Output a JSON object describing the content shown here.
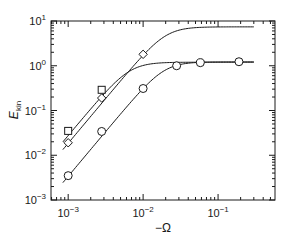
{
  "chart_data": {
    "type": "line",
    "title": "",
    "xlabel": "−Ω",
    "ylabel": "E_kin",
    "xscale": "log",
    "yscale": "log",
    "xlim": [
      0.00059,
      0.575
    ],
    "ylim": [
      0.001,
      10
    ],
    "grid": false,
    "legend": null,
    "x_ticks": [
      {
        "value": 0.001,
        "base": "10",
        "exp": "−3"
      },
      {
        "value": 0.01,
        "base": "10",
        "exp": "−2"
      },
      {
        "value": 0.1,
        "base": "10",
        "exp": "−1"
      }
    ],
    "y_ticks": [
      {
        "value": 0.001,
        "base": "10",
        "exp": "−3"
      },
      {
        "value": 0.01,
        "base": "10",
        "exp": "−2"
      },
      {
        "value": 0.1,
        "base": "10",
        "exp": "−1"
      },
      {
        "value": 1,
        "base": "10",
        "exp": "0"
      },
      {
        "value": 10,
        "base": "10",
        "exp": "1"
      }
    ],
    "series": [
      {
        "name": "squares",
        "marker": "square",
        "points": [
          {
            "x": 0.001,
            "y": 0.035
          },
          {
            "x": 0.0028,
            "y": 0.29
          }
        ],
        "fit": {
          "slope": 2,
          "plateau": 1.2,
          "x_start": 0.00085,
          "x_end": 0.3,
          "knee": 0.0066
        }
      },
      {
        "name": "diamonds",
        "marker": "diamond",
        "points": [
          {
            "x": 0.001,
            "y": 0.019
          },
          {
            "x": 0.0028,
            "y": 0.19
          },
          {
            "x": 0.01,
            "y": 1.8
          }
        ],
        "fit": {
          "slope": 2,
          "plateau": 7.4,
          "x_start": 0.00085,
          "x_end": 0.3,
          "knee": 0.02
        }
      },
      {
        "name": "circles",
        "marker": "circle",
        "points": [
          {
            "x": 0.001,
            "y": 0.0035
          },
          {
            "x": 0.0028,
            "y": 0.034
          },
          {
            "x": 0.01,
            "y": 0.31
          },
          {
            "x": 0.028,
            "y": 1.0
          },
          {
            "x": 0.058,
            "y": 1.17
          },
          {
            "x": 0.19,
            "y": 1.23
          }
        ],
        "fit": {
          "slope": 2,
          "plateau": 1.22,
          "x_start": 0.00085,
          "x_end": 0.3,
          "knee": 0.019
        }
      }
    ]
  },
  "colors": {
    "line": "#1a1a1a",
    "background": "#ffffff"
  }
}
